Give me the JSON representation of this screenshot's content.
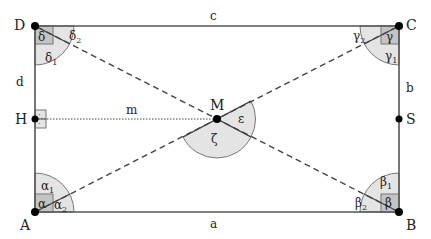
{
  "diagram": {
    "points": {
      "A": {
        "label": "A",
        "x": 35,
        "y": 212
      },
      "B": {
        "label": "B",
        "x": 399,
        "y": 212
      },
      "C": {
        "label": "C",
        "x": 399,
        "y": 26
      },
      "D": {
        "label": "D",
        "x": 35,
        "y": 26
      },
      "M": {
        "label": "M",
        "x": 217,
        "y": 119
      },
      "H": {
        "label": "H",
        "x": 35,
        "y": 119
      },
      "S": {
        "label": "S",
        "x": 399,
        "y": 119
      }
    },
    "sides": {
      "a": "a",
      "b": "b",
      "c": "c",
      "d": "d",
      "m": "m"
    },
    "angles": {
      "alpha": "α",
      "alpha1": "α",
      "alpha1_sub": "1",
      "alpha2": "α",
      "alpha2_sub": "2",
      "beta": "β",
      "beta1": "β",
      "beta1_sub": "1",
      "beta2": "β",
      "beta2_sub": "2",
      "gamma": "γ",
      "gamma1": "γ",
      "gamma1_sub": "1",
      "gamma2": "γ",
      "gamma2_sub": "2",
      "delta": "δ",
      "delta1": "δ",
      "delta1_sub": "1",
      "delta2": "δ",
      "delta2_sub": "2",
      "epsilon": "ε",
      "zeta": "ζ",
      "right_angle_dot": "·"
    },
    "colors": {
      "line": "#555555",
      "arc_fill": "#e4e4e4",
      "square_fill": "#c4c4c4",
      "point": "#000000"
    }
  }
}
